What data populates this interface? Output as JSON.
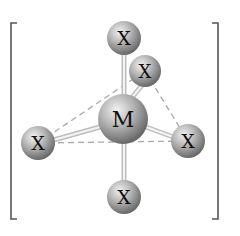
{
  "diagram": {
    "type": "molecular-geometry",
    "central_atom": {
      "label": "M",
      "cx": 123,
      "cy": 119,
      "r": 25
    },
    "ligands": [
      {
        "id": "axial-top",
        "label": "X",
        "cx": 124,
        "cy": 38,
        "r": 17
      },
      {
        "id": "equatorial-back",
        "label": "X",
        "cx": 145,
        "cy": 71,
        "r": 16
      },
      {
        "id": "equatorial-left",
        "label": "X",
        "cx": 38,
        "cy": 143,
        "r": 17
      },
      {
        "id": "equatorial-right",
        "label": "X",
        "cx": 188,
        "cy": 141,
        "r": 17
      },
      {
        "id": "axial-bottom",
        "label": "X",
        "cx": 124,
        "cy": 197,
        "r": 17
      }
    ],
    "dashed_edges": [
      [
        "equatorial-left",
        "equatorial-back"
      ],
      [
        "equatorial-back",
        "equatorial-right"
      ],
      [
        "equatorial-left",
        "equatorial-right"
      ]
    ],
    "brackets": {
      "left_x": 11,
      "right_x": 218,
      "top_y": 23,
      "bottom_y": 219
    },
    "colors": {
      "atom_light": "#e6e6e6",
      "atom_mid": "#a8a8a8",
      "atom_dark": "#5e5e5e",
      "bond": "#cfcfcf",
      "dash": "#a9a9a9",
      "bracket": "#555555"
    }
  }
}
